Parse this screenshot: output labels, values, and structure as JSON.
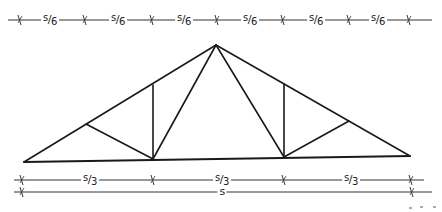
{
  "diagram": {
    "title": "",
    "type": "truss-elevation",
    "truss": {
      "nodes": {
        "left_support": [
          24,
          162
        ],
        "right_support": [
          410,
          156
        ],
        "apex": [
          216,
          45
        ],
        "top_left_panel": [
          86,
          124
        ],
        "top_left_vertical": [
          153,
          85
        ],
        "top_right_vertical": [
          284,
          84
        ],
        "top_right_panel": [
          349,
          121
        ],
        "bottom_left": [
          153,
          159
        ],
        "bottom_right": [
          284,
          157
        ]
      },
      "members": [
        [
          "left_support",
          "apex"
        ],
        [
          "apex",
          "right_support"
        ],
        [
          "left_support",
          "right_support"
        ],
        [
          "top_left_panel",
          "bottom_left"
        ],
        [
          "top_left_vertical",
          "bottom_left"
        ],
        [
          "bottom_left",
          "apex"
        ],
        [
          "apex",
          "bottom_right"
        ],
        [
          "top_right_vertical",
          "bottom_right"
        ],
        [
          "bottom_right",
          "top_right_panel"
        ]
      ]
    },
    "dimension_lines": [
      {
        "name": "top-dimension-line",
        "y": 20,
        "x_start": 8,
        "x_end": 432,
        "ticks": [
          20,
          85,
          152,
          217,
          283,
          349,
          409
        ],
        "segment_label": {
          "num": "s",
          "den": "6"
        },
        "labels": [
          {
            "x": 50,
            "text_num": "s",
            "text_den": "6"
          },
          {
            "x": 118,
            "text_num": "s",
            "text_den": "6"
          },
          {
            "x": 184,
            "text_num": "s",
            "text_den": "6"
          },
          {
            "x": 250,
            "text_num": "s",
            "text_den": "6"
          },
          {
            "x": 316,
            "text_num": "s",
            "text_den": "6"
          },
          {
            "x": 378,
            "text_num": "s",
            "text_den": "6"
          }
        ]
      },
      {
        "name": "middle-dimension-line",
        "y": 180,
        "x_start": 14,
        "x_end": 424,
        "ticks": [
          22,
          153,
          284,
          411
        ],
        "labels": [
          {
            "x": 90,
            "text_num": "s",
            "text_den": "3"
          },
          {
            "x": 222,
            "text_num": "s",
            "text_den": "3"
          },
          {
            "x": 351,
            "text_num": "s",
            "text_den": "3"
          }
        ]
      },
      {
        "name": "bottom-dimension-line",
        "y": 192,
        "x_start": 14,
        "x_end": 432,
        "ticks": [
          22,
          412
        ],
        "labels": [
          {
            "x": 222,
            "text": "s"
          }
        ]
      }
    ],
    "colors": {
      "ink": "#1a1a1a",
      "dimension_ink": "#333333",
      "background": "#ffffff",
      "speck": "#aaaaaa"
    }
  }
}
